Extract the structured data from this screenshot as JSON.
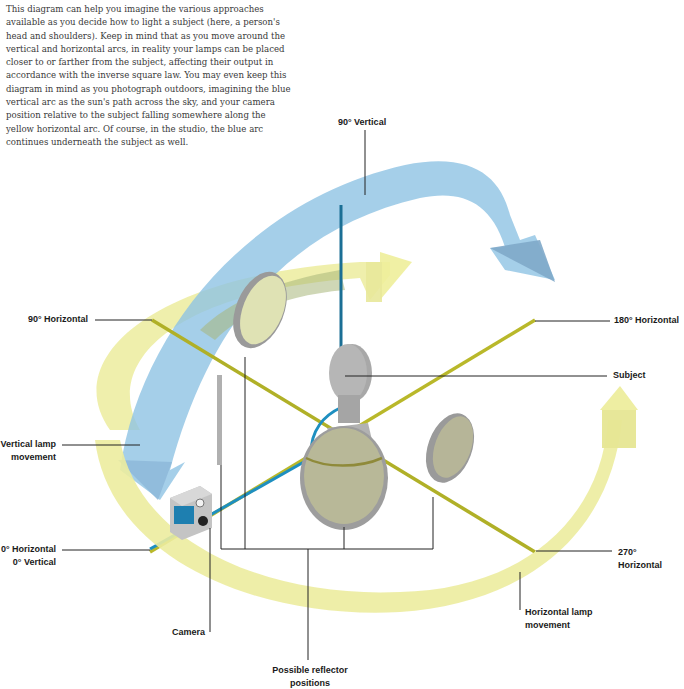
{
  "intro_text": "This diagram can help you imagine the various approaches available as you decide how to light a subject (here, a person's head and shoulders). Keep in mind that as you move around the vertical and horizontal arcs, in reality your lamps can be placed closer to or farther from the subject, affecting their output in accordance with the inverse square law. You may even keep this diagram in mind as you photograph outdoors, imagining the blue vertical arc as the sun's path across the sky, and your camera position relative to the subject falling somewhere along the yellow horizontal arc. Of course, in the studio, the blue arc continues underneath the subject as well.",
  "labels": {
    "vertical_90": "90° Vertical",
    "horizontal_90": "90° Horizontal",
    "horizontal_180": "180° Horizontal",
    "subject": "Subject",
    "vertical_lamp_movement_1": "Vertical lamp",
    "vertical_lamp_movement_2": "movement",
    "horizontal_0": "0° Horizontal",
    "vertical_0": "0° Vertical",
    "horizontal_270_1": "270°",
    "horizontal_270_2": "Horizontal",
    "horizontal_lamp_movement_1": "Horizontal lamp",
    "horizontal_lamp_movement_2": "movement",
    "camera": "Camera",
    "reflector_positions_1": "Possible reflector",
    "reflector_positions_2": "positions"
  },
  "colors": {
    "vertical_arc": "#8fc3e3",
    "horizontal_arc": "#ecec9e",
    "horizontal_axis": "#b9b82a",
    "vertical_axis": "#1e8fc0",
    "reflector_fill": "#b9b99a",
    "reflector_rim": "#9a9a9a",
    "subject": "#a9a9a9",
    "leader_line": "#222222"
  }
}
